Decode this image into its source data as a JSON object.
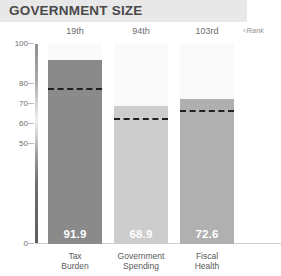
{
  "header": {
    "title": "GOVERNMENT SIZE",
    "banner_color": "#e8e8e8",
    "title_color": "#4a4a4a"
  },
  "rank_row": {
    "note": "Rank",
    "note_chevron": "‹",
    "ranks": [
      "19th",
      "94th",
      "103rd"
    ]
  },
  "chart_data": {
    "type": "bar",
    "title": "GOVERNMENT SIZE",
    "xlabel": "",
    "ylabel": "",
    "ylim": [
      0,
      100
    ],
    "yticks": [
      100,
      80,
      70,
      60,
      50,
      0
    ],
    "ytick_labels": [
      "100",
      "80",
      "70",
      "60",
      "50",
      "0"
    ],
    "grid": false,
    "legend": "none",
    "categories": [
      "Tax Burden",
      "Government Spending",
      "Fiscal Health"
    ],
    "category_lines": [
      [
        "Tax",
        "Burden"
      ],
      [
        "Government",
        "Spending"
      ],
      [
        "Fiscal",
        "Health"
      ]
    ],
    "values": [
      91.9,
      68.9,
      72.6
    ],
    "value_labels": [
      "91.9",
      "68.9",
      "72.6"
    ],
    "ranks": [
      "19th",
      "94th",
      "103rd"
    ],
    "reference_lines": [
      77.0,
      62.0,
      66.0
    ],
    "reference_line_style": "dashed",
    "reference_line_color": "#202020",
    "bar_colors": [
      "#8a8a8a",
      "#cdcdcd",
      "#b0b0b0"
    ],
    "column_background_color": "#fafafa",
    "axis_color": "#cfcfcf"
  }
}
